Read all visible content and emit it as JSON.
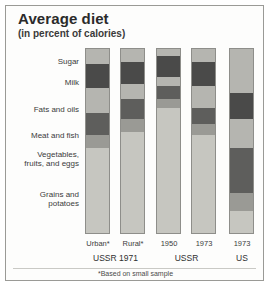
{
  "header": {
    "title": "Average diet",
    "subtitle": "(in percent of calories)"
  },
  "footnote": "*Based on small sample",
  "chart_data": {
    "type": "bar",
    "title": "Average diet",
    "subtitle": "(in percent of calories)",
    "xlabel": "",
    "ylabel": "percent of calories",
    "ylim": [
      0,
      100
    ],
    "grid": false,
    "legend_position": "left-labels",
    "stacked": true,
    "annotations": [
      "*Based on small sample"
    ],
    "categories": [
      "Grains and\npotatoes",
      "Vegetables,\nfruits, and eggs",
      "Meat and fish",
      "Fats and oils",
      "Milk",
      "Sugar"
    ],
    "category_colors": {
      "Grains and\npotatoes": "#c6c6c0",
      "Vegetables,\nfruits, and eggs": "#9a9a95",
      "Meat and fish": "#5e5e5c",
      "Fats and oils": "#b5b5b0",
      "Milk": "#4a4a49",
      "Sugar": "#b5b5b0"
    },
    "bars": [
      {
        "id": "ussr-1971-urban",
        "caption": "Urban*",
        "group": "USSR 1971",
        "values": [
          46,
          7,
          12,
          14,
          13,
          8
        ]
      },
      {
        "id": "ussr-1971-rural",
        "caption": "Rural*",
        "group": "USSR 1971",
        "values": [
          55,
          7,
          11,
          8,
          12,
          7
        ]
      },
      {
        "id": "ussr-1950",
        "caption": "1950",
        "group": "USSR",
        "values": [
          68,
          5,
          7,
          5,
          11,
          4
        ]
      },
      {
        "id": "ussr-1973",
        "caption": "1973",
        "group": "USSR",
        "values": [
          53,
          6,
          9,
          12,
          13,
          7
        ]
      },
      {
        "id": "us-1973",
        "caption": "1973",
        "group": "US",
        "values": [
          12,
          10,
          24,
          16,
          14,
          24
        ]
      }
    ],
    "groups": [
      {
        "label": "USSR 1971",
        "bars": [
          "ussr-1971-urban",
          "ussr-1971-rural"
        ]
      },
      {
        "label": "USSR",
        "bars": [
          "ussr-1950",
          "ussr-1973"
        ]
      },
      {
        "label": "US",
        "bars": [
          "us-1973"
        ]
      }
    ]
  },
  "labels": {
    "sugar": "Sugar",
    "milk": "Milk",
    "fats": "Fats and oils",
    "meat": "Meat and fish",
    "vegetables_l1": "Vegetables,",
    "vegetables_l2": "fruits, and eggs",
    "grains_l1": "Grains and",
    "grains_l2": "potatoes"
  },
  "bar_captions": {
    "b1": "Urban*",
    "b2": "Rural*",
    "b3": "1950",
    "b4": "1973",
    "b5": "1973"
  },
  "group_captions": {
    "g1": "USSR 1971",
    "g2": "USSR",
    "g3": "US"
  }
}
